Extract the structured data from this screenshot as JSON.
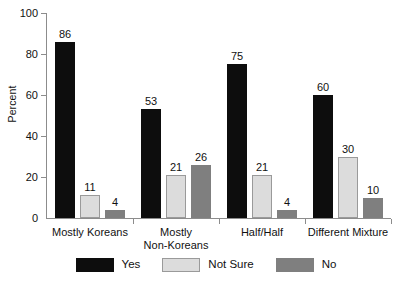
{
  "chart_data": {
    "type": "bar",
    "title": "",
    "subtitle": "",
    "xlabel": "",
    "ylabel": "Percent",
    "ylim": [
      0,
      100
    ],
    "yticks": [
      0,
      20,
      40,
      60,
      80,
      100
    ],
    "ytick_labels": [
      "0",
      "20",
      "40",
      "60",
      "80",
      "100"
    ],
    "grid": false,
    "legend_position": "bottom-center",
    "categories": [
      "Mostly Koreans",
      "Mostly\nNon-Koreans",
      "Half/Half",
      "Different Mixture"
    ],
    "series": [
      {
        "name": "Yes",
        "color": "#0d0d0d",
        "values": [
          86,
          53,
          75,
          60
        ]
      },
      {
        "name": "Not Sure",
        "color": "#dcdcdc",
        "values": [
          11,
          21,
          21,
          30
        ]
      },
      {
        "name": "No",
        "color": "#7f7f7f",
        "values": [
          4,
          26,
          4,
          10
        ]
      }
    ],
    "data_labels": [
      "86",
      "11",
      "4",
      "53",
      "21",
      "26",
      "75",
      "21",
      "4",
      "60",
      "30",
      "10"
    ],
    "axis_color": "#8c8c8c",
    "text_color": "#111111"
  },
  "yaxis": {
    "title": "Percent",
    "ticks": [
      {
        "label": "100",
        "value": 100
      },
      {
        "label": "80",
        "value": 80
      },
      {
        "label": "60",
        "value": 60
      },
      {
        "label": "40",
        "value": 40
      },
      {
        "label": "20",
        "value": 20
      },
      {
        "label": "0",
        "value": 0
      }
    ]
  },
  "xaxis": {
    "groups": [
      {
        "label": "Mostly Koreans"
      },
      {
        "label": "Mostly\nNon-Koreans"
      },
      {
        "label": "Half/Half"
      },
      {
        "label": "Different Mixture"
      }
    ]
  },
  "legend": {
    "items": [
      {
        "label": "Yes",
        "swatch": "yes"
      },
      {
        "label": "Not Sure",
        "swatch": "not-sure"
      },
      {
        "label": "No",
        "swatch": "no"
      }
    ]
  },
  "bars": [
    {
      "group": 0,
      "series": 0,
      "value": 86,
      "label": "86",
      "cls": "yes"
    },
    {
      "group": 0,
      "series": 1,
      "value": 11,
      "label": "11",
      "cls": "not-sure"
    },
    {
      "group": 0,
      "series": 2,
      "value": 4,
      "label": "4",
      "cls": "no"
    },
    {
      "group": 1,
      "series": 0,
      "value": 53,
      "label": "53",
      "cls": "yes"
    },
    {
      "group": 1,
      "series": 1,
      "value": 21,
      "label": "21",
      "cls": "not-sure"
    },
    {
      "group": 1,
      "series": 2,
      "value": 26,
      "label": "26",
      "cls": "no"
    },
    {
      "group": 2,
      "series": 0,
      "value": 75,
      "label": "75",
      "cls": "yes"
    },
    {
      "group": 2,
      "series": 1,
      "value": 21,
      "label": "21",
      "cls": "not-sure"
    },
    {
      "group": 2,
      "series": 2,
      "value": 4,
      "label": "4",
      "cls": "no"
    },
    {
      "group": 3,
      "series": 0,
      "value": 60,
      "label": "60",
      "cls": "yes"
    },
    {
      "group": 3,
      "series": 1,
      "value": 30,
      "label": "30",
      "cls": "not-sure"
    },
    {
      "group": 3,
      "series": 2,
      "value": 10,
      "label": "10",
      "cls": "no"
    }
  ]
}
